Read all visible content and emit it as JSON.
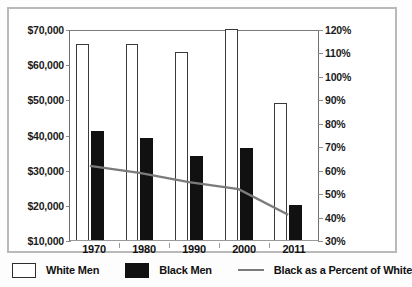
{
  "chart_data": {
    "type": "bar",
    "title": "",
    "subtitle": "",
    "xlabel": "",
    "ylabel": "",
    "categories": [
      "1970",
      "1980",
      "1990",
      "2000",
      "2011"
    ],
    "series": [
      {
        "name": "White Men",
        "type": "bar",
        "axis": "left",
        "color": "#ffffff",
        "edge_color": "#3a3a3a",
        "values": [
          65800,
          65700,
          63400,
          70000,
          48900
        ]
      },
      {
        "name": "Black Men",
        "type": "bar",
        "axis": "left",
        "color": "#111111",
        "values": [
          41000,
          39000,
          34000,
          36300,
          20000
        ]
      },
      {
        "name": "Black as a Percent of White",
        "type": "line",
        "axis": "right",
        "color": "#7b7b7b",
        "values": [
          62,
          59,
          55,
          52,
          41
        ]
      }
    ],
    "left_axis": {
      "ticks": [
        "$10,000",
        "$20,000",
        "$30,000",
        "$40,000",
        "$50,000",
        "$60,000",
        "$70,000"
      ],
      "values": [
        10000,
        20000,
        30000,
        40000,
        50000,
        60000,
        70000
      ],
      "ylim": [
        10000,
        70000
      ]
    },
    "right_axis": {
      "ticks": [
        "30%",
        "40%",
        "50%",
        "60%",
        "70%",
        "80%",
        "90%",
        "100%",
        "110%",
        "120%"
      ],
      "values": [
        30,
        40,
        50,
        60,
        70,
        80,
        90,
        100,
        110,
        120
      ],
      "ylim": [
        30,
        120
      ]
    },
    "grid": false,
    "legend_position": "bottom"
  },
  "legend": {
    "items": [
      {
        "label": "White Men",
        "marker": "white-square"
      },
      {
        "label": "Black Men",
        "marker": "black-square"
      },
      {
        "label": "Black as a Percent of White",
        "marker": "line"
      }
    ]
  }
}
